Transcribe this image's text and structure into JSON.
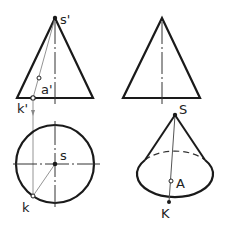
{
  "figure": {
    "labels": {
      "apex_front": "s'",
      "point_a_front": "a'",
      "point_k_front": "k'",
      "apex_top": "s",
      "point_k_top": "k",
      "apex_3d": "S",
      "point_a_3d": "A",
      "point_k_3d": "K"
    },
    "colors": {
      "outline": "#1a1a1a",
      "construction": "#888888"
    }
  }
}
